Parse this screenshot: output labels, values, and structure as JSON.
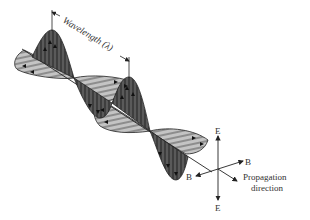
{
  "figure": {
    "wavelength_label": "Wavelength (λ)",
    "legend": {
      "e_up": "E",
      "e_down": "E",
      "b_right": "B",
      "b_left": "B",
      "propagation_line1": "Propagation",
      "propagation_line2": "direction"
    },
    "colors": {
      "electric_field": "#4a4a4a",
      "magnetic_field": "#b5b5b5",
      "lines": "#222222",
      "text": "#333333",
      "background": "#ffffff"
    }
  }
}
